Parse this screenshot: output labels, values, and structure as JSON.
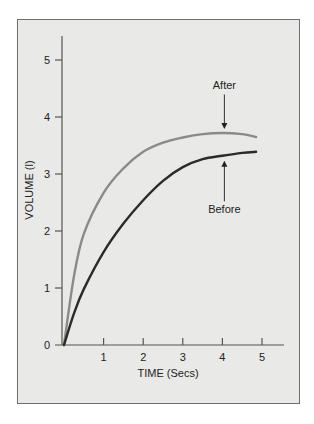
{
  "chart_data": {
    "type": "line",
    "title": "",
    "xlabel": "TIME (Secs)",
    "ylabel": "VOLUME (l)",
    "xlim": [
      0,
      5.5
    ],
    "ylim": [
      0,
      5.4
    ],
    "xticks": [
      1,
      2,
      3,
      4,
      5
    ],
    "yticks": [
      0,
      1,
      2,
      3,
      4,
      5
    ],
    "grid": false,
    "legend": "none (direct annotations)",
    "series": [
      {
        "name": "After",
        "color": "#8a8a8a",
        "x": [
          0,
          0.25,
          0.5,
          1,
          1.5,
          2,
          2.5,
          3,
          3.5,
          4,
          4.5,
          4.85
        ],
        "y": [
          0,
          1.2,
          1.95,
          2.67,
          3.1,
          3.39,
          3.55,
          3.64,
          3.7,
          3.72,
          3.7,
          3.65
        ]
      },
      {
        "name": "Before",
        "color": "#2b2b2b",
        "x": [
          0,
          0.25,
          0.5,
          1,
          1.5,
          2,
          2.5,
          3,
          3.5,
          4,
          4.5,
          4.85
        ],
        "y": [
          0,
          0.55,
          0.98,
          1.63,
          2.13,
          2.54,
          2.88,
          3.12,
          3.26,
          3.32,
          3.37,
          3.39
        ]
      }
    ],
    "annotations": [
      {
        "text": "After",
        "x": 4.05,
        "y": 3.72,
        "arrow": "down",
        "label_y": 4.5
      },
      {
        "text": "Before",
        "x": 4.05,
        "y": 3.32,
        "arrow": "up",
        "label_y": 2.45
      }
    ]
  }
}
